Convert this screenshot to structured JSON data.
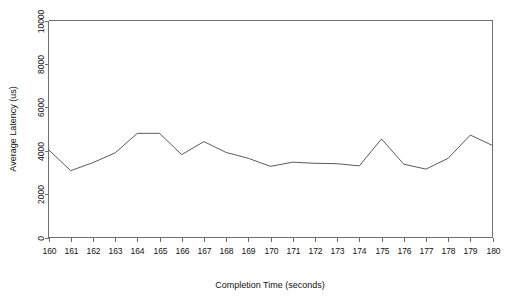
{
  "chart_data": {
    "type": "line",
    "title": "",
    "subtitle": "",
    "xlabel": "Completion Time (seconds)",
    "ylabel": "Average Latency (us)",
    "xlim": [
      160,
      180
    ],
    "ylim": [
      0,
      10000
    ],
    "grid": false,
    "legend": null,
    "legend_position": "none",
    "x_ticks": [
      160,
      161,
      162,
      163,
      164,
      165,
      166,
      167,
      168,
      169,
      170,
      171,
      172,
      173,
      174,
      175,
      176,
      177,
      178,
      179,
      180
    ],
    "x_tick_labels": [
      "160",
      "161",
      "162",
      "163",
      "164",
      "165",
      "166",
      "167",
      "168",
      "169",
      "170",
      "171",
      "172",
      "173",
      "174",
      "175",
      "176",
      "177",
      "178",
      "179",
      "180"
    ],
    "y_ticks": [
      0,
      2000,
      4000,
      6000,
      8000,
      10000
    ],
    "y_tick_labels": [
      "0",
      "2000",
      "4000",
      "6000",
      "8000",
      "10000"
    ],
    "x": [
      160,
      161,
      162,
      163,
      164,
      165,
      166,
      167,
      168,
      169,
      170,
      171,
      172,
      173,
      174,
      175,
      176,
      177,
      178,
      179,
      180
    ],
    "values": [
      4050,
      3080,
      3450,
      3900,
      4800,
      4800,
      3820,
      4420,
      3920,
      3650,
      3280,
      3470,
      3420,
      3400,
      3300,
      4540,
      3380,
      3150,
      3650,
      4720,
      4240
    ],
    "series": [
      {
        "name": "Average Latency",
        "color": "#5a5a5a",
        "values": [
          4050,
          3080,
          3450,
          3900,
          4800,
          4800,
          3820,
          4420,
          3920,
          3650,
          3280,
          3470,
          3420,
          3400,
          3300,
          4540,
          3380,
          3150,
          3650,
          4720,
          4240
        ]
      }
    ]
  },
  "colors": {
    "line": "#5a5a5a",
    "axis": "#6e6e6e",
    "text": "#111111",
    "background": "#ffffff"
  }
}
